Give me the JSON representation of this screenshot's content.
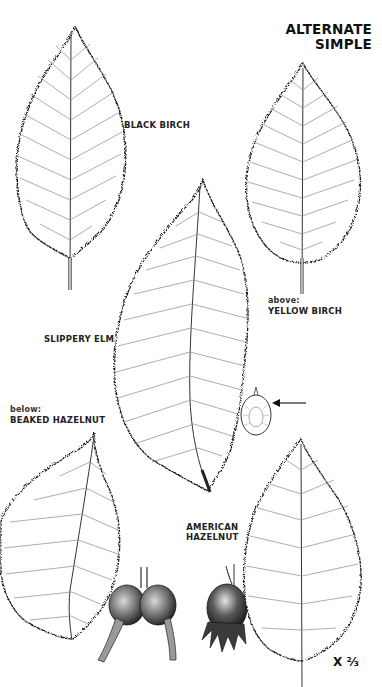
{
  "page": {
    "heading": {
      "line1": "ALTERNATE",
      "line2": "SIMPLE"
    },
    "scale": {
      "prefix": "X",
      "fraction": "⅔"
    }
  },
  "specimens": [
    {
      "id": "black-birch",
      "prefix": "",
      "name": "BLACK BIRCH"
    },
    {
      "id": "yellow-birch",
      "prefix": "above:",
      "name": "YELLOW BIRCH"
    },
    {
      "id": "slippery-elm",
      "prefix": "",
      "name": "SLIPPERY ELM"
    },
    {
      "id": "beaked-hazelnut",
      "prefix": "below:",
      "name": "BEAKED HAZELNUT"
    },
    {
      "id": "american-hazelnut",
      "prefix": "",
      "name": "AMERICAN",
      "name2": "HAZELNUT"
    }
  ],
  "colors": {
    "ink": "#1a1a1a",
    "vein": "#8a8a8a",
    "paper": "#ffffff"
  }
}
